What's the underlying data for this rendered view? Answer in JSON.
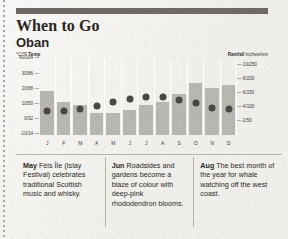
{
  "header": {
    "title": "When to Go",
    "subtitle": "Oban"
  },
  "chart_data": {
    "type": "bar",
    "categories": [
      "J",
      "F",
      "M",
      "A",
      "M",
      "J",
      "J",
      "A",
      "S",
      "O",
      "N",
      "D"
    ],
    "xlabel": "",
    "grid": false,
    "legend_position": "top",
    "series": [
      {
        "name": "Rainfall",
        "type": "bar",
        "unit": "Inches/mm",
        "axis": "right",
        "legend_label": "Rainfall",
        "legend_unit": "Inches/mm",
        "values": [
          6.4,
          4.8,
          4.4,
          3.2,
          3.2,
          3.6,
          4.4,
          4.8,
          6.0,
          7.6,
          6.8,
          7.2
        ],
        "values_mm": [
          160,
          120,
          110,
          80,
          80,
          90,
          110,
          120,
          150,
          190,
          170,
          180
        ],
        "ylim": [
          0,
          11
        ],
        "ticks": [
          {
            "label": "10/250",
            "value": 10
          },
          {
            "label": "8/200",
            "value": 8
          },
          {
            "label": "6/150",
            "value": 6
          },
          {
            "label": "4/100",
            "value": 4
          },
          {
            "label": "2/50",
            "value": 2
          }
        ]
      },
      {
        "name": "Temp",
        "type": "scatter",
        "unit": "°C/°F",
        "axis": "left",
        "legend_label": "Temp",
        "legend_unit": "°C/°F",
        "values": [
          6,
          6,
          7,
          9,
          12,
          14,
          15,
          15,
          13,
          11,
          8,
          7
        ],
        "ylim": [
          -10,
          40
        ],
        "ticks": [
          {
            "label": "40/104",
            "value": 40
          },
          {
            "label": "30/86",
            "value": 30
          },
          {
            "label": "20/68",
            "value": 20
          },
          {
            "label": "10/50",
            "value": 10
          },
          {
            "label": "0/32",
            "value": 0
          },
          {
            "label": "-10/14",
            "value": -10
          }
        ]
      }
    ]
  },
  "notes": [
    {
      "month": "May",
      "text": " Fèis Île (Islay Festival) celebrates traditional Scottish music and whisky."
    },
    {
      "month": "Jun",
      "text": " Roadsides and gardens become a blaze of colour with deep-pink rhododendron blooms."
    },
    {
      "month": "Aug",
      "text": " The best month of the year for whale watching off the west coast."
    }
  ]
}
